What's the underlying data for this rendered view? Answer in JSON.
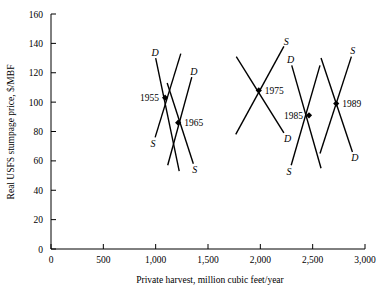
{
  "chart_data": {
    "type": "line",
    "title": "",
    "xlabel": "Private harvest, million cubic feet/year",
    "ylabel": "Real USFS stumpage price, $/MBF",
    "xlim": [
      0,
      3000
    ],
    "ylim": [
      0,
      160
    ],
    "xticks": [
      0,
      500,
      1000,
      1500,
      2000,
      2500,
      3000
    ],
    "xtick_labels": [
      "0",
      "500",
      "1,000",
      "1,500",
      "2,000",
      "2,500",
      "3,000"
    ],
    "yticks": [
      0,
      20,
      40,
      60,
      80,
      100,
      120,
      140,
      160
    ],
    "ytick_labels": [
      "0",
      "20",
      "40",
      "60",
      "80",
      "100",
      "120",
      "140",
      "160"
    ],
    "grid": false,
    "legend": "none",
    "series_note": "Each year shows an intersecting supply (S) and demand (D) curve pair; the equilibrium point is marked with a solid marker.",
    "equilibria": [
      {
        "year": "1955",
        "x": 1090,
        "y": 103
      },
      {
        "year": "1965",
        "x": 1215,
        "y": 86
      },
      {
        "year": "1975",
        "x": 1985,
        "y": 108
      },
      {
        "year": "1985",
        "x": 2465,
        "y": 91
      },
      {
        "year": "1989",
        "x": 2725,
        "y": 99
      }
    ],
    "crosses": [
      {
        "year": "1955",
        "year_label_side": "left",
        "demand": {
          "x1": 1000,
          "y1": 130,
          "x2": 1225,
          "y2": 53,
          "label": "D",
          "label_at": "start"
        },
        "supply": {
          "x1": 995,
          "y1": 76,
          "x2": 1240,
          "y2": 133,
          "label": "S",
          "label_at": "start"
        }
      },
      {
        "year": "1965",
        "year_label_side": "right",
        "demand": {
          "x1": 1115,
          "y1": 57,
          "x2": 1345,
          "y2": 117,
          "label": "D",
          "label_at": "end"
        },
        "supply": {
          "x1": 1110,
          "y1": 113,
          "x2": 1360,
          "y2": 58,
          "label": "S",
          "label_at": "end"
        }
      },
      {
        "year": "1975",
        "year_label_side": "right",
        "demand": {
          "x1": 1770,
          "y1": 131,
          "x2": 2225,
          "y2": 79,
          "label": "D",
          "label_at": "end"
        },
        "supply": {
          "x1": 1765,
          "y1": 78,
          "x2": 2225,
          "y2": 138,
          "label": "S",
          "label_at": "end"
        }
      },
      {
        "year": "1985",
        "year_label_side": "left",
        "demand": {
          "x1": 2300,
          "y1": 125,
          "x2": 2580,
          "y2": 55,
          "label": "D",
          "label_at": "start"
        },
        "supply": {
          "x1": 2295,
          "y1": 57,
          "x2": 2570,
          "y2": 125,
          "label": "S",
          "label_at": "start"
        }
      },
      {
        "year": "1989",
        "year_label_side": "right",
        "demand": {
          "x1": 2580,
          "y1": 130,
          "x2": 2880,
          "y2": 66,
          "label": "D",
          "label_at": "end"
        },
        "supply": {
          "x1": 2570,
          "y1": 65,
          "x2": 2870,
          "y2": 131,
          "label": "S",
          "label_at": "end"
        }
      }
    ]
  }
}
